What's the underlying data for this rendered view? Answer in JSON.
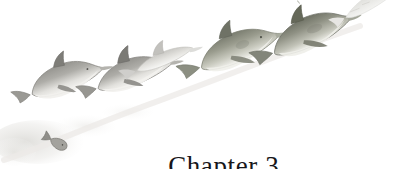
{
  "page": {
    "width": 418,
    "height": 169,
    "background_color": "#ffffff",
    "kind": "book-chapter-opener"
  },
  "heading": {
    "full_text": "Chapter 3",
    "word": "Chapter",
    "number": "3",
    "color": "#17161a",
    "align": "center"
  },
  "illustration": {
    "title": "watercolor pod of dolphins swimming upward to the right",
    "medium": "watercolor",
    "palette": {
      "body_gray": "#a9a8a3",
      "body_gray_dark": "#7e7d79",
      "body_green_gray": "#9a9c8e",
      "body_green_dark": "#6f7265",
      "belly_light": "#e9e8e4",
      "wash_faint": "#dcdbd7",
      "outline": "#6a6a66",
      "trail_smudge": "#e4e3df"
    },
    "creatures": [
      {
        "name": "dolphin-1-front-left",
        "type": "bottlenose-dolphin",
        "size": "medium",
        "tone": "gray",
        "x": 22,
        "y": 66,
        "width": 68,
        "height": 44,
        "rotation": -18
      },
      {
        "name": "dolphin-2-lower-middle",
        "type": "bottlenose-dolphin",
        "size": "medium",
        "tone": "gray",
        "x": 84,
        "y": 60,
        "width": 72,
        "height": 42,
        "rotation": -18
      },
      {
        "name": "dolphin-3-pale-slim",
        "type": "bottlenose-dolphin",
        "size": "slim-pale",
        "tone": "very-light-gray",
        "x": 128,
        "y": 52,
        "width": 62,
        "height": 26,
        "rotation": -20
      },
      {
        "name": "dolphin-4-large-middle",
        "type": "porpoise",
        "size": "large",
        "tone": "green-gray",
        "x": 186,
        "y": 36,
        "width": 82,
        "height": 42,
        "rotation": -20
      },
      {
        "name": "dolphin-5-large-right",
        "type": "porpoise",
        "size": "large",
        "tone": "green-gray-dark",
        "x": 258,
        "y": 22,
        "width": 82,
        "height": 44,
        "rotation": -22
      },
      {
        "name": "dolphin-6-faint-top-right",
        "type": "dolphin-silhouette-fading",
        "size": "small",
        "tone": "faint-gray",
        "x": 337,
        "y": 2,
        "width": 76,
        "height": 30,
        "rotation": -26
      },
      {
        "name": "small-fish",
        "type": "fish",
        "size": "tiny",
        "tone": "gray",
        "x": 52,
        "y": 133,
        "width": 20,
        "height": 12,
        "rotation": 28
      }
    ],
    "wash_trail": {
      "name": "watercolor-trail",
      "x": 0,
      "y": 110,
      "width": 120,
      "height": 58
    }
  }
}
